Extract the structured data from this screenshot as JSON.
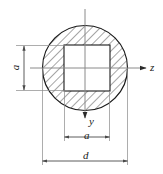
{
  "figure": {
    "type": "engineering-cross-section-diagram",
    "labels": {
      "dimension_a_vertical": "a",
      "dimension_a_horizontal": "a",
      "dimension_d": "d",
      "axis_z": "z",
      "axis_y": "y"
    },
    "icons": {
      "arrow_right": "arrow-right-icon",
      "arrow_down": "arrow-down-icon",
      "dimension_arrow": "dimension-arrow-icon"
    },
    "colors": {
      "outline": "#1a1a1a",
      "hatch": "#3a3a3a",
      "axis": "#808080",
      "dimension": "#4a4a4a",
      "background": "#ffffff"
    },
    "geometry": {
      "circle_center_x": 85,
      "circle_center_y": 68,
      "circle_radius": 43,
      "square_left": 64,
      "square_top": 45,
      "square_size": 46,
      "hatch_angle_deg": 45
    }
  }
}
